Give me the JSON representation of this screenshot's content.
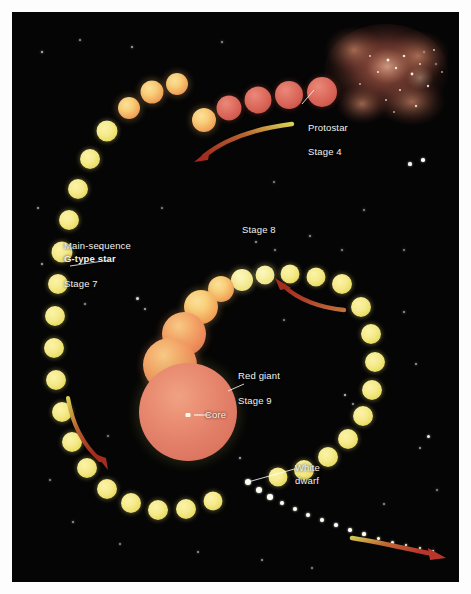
{
  "figure": {
    "background_color": "#050505",
    "page_color": "#fdfdfd"
  },
  "labels": {
    "protostar": "Protostar",
    "stage4": "Stage 4",
    "main_sequence_line1": "Main-sequence",
    "main_sequence_line2": "G-type star",
    "stage7": "Stage 7",
    "stage8": "Stage 8",
    "red_giant": "Red giant",
    "stage9": "Stage 9",
    "core": "Core",
    "white_dwarf_line1": "White",
    "white_dwarf_line2": "dwarf"
  },
  "colors": {
    "label_text": "#f2f2ee",
    "yellow_star": "#f0e487",
    "orange_star": "#f3ac5e",
    "red_star": "#d55f53",
    "red_giant": "#e27f68",
    "arrow_red": "#b8372a",
    "arrow_yellow": "#d8cf5a",
    "nebula": "#a85445"
  },
  "icons": {
    "protostar_leader": "leader-line",
    "main_sequence_leader": "leader-line",
    "red_giant_leader": "leader-line",
    "white_dwarf_leader": "leader-line",
    "core_pointer": "core-marker",
    "arrow_top": "curved-arrow-left",
    "arrow_left": "curved-arrow-down",
    "arrow_center": "curved-arrow-upleft",
    "arrow_bottom": "curved-arrow-right"
  },
  "sequences": {
    "outer_ring_note": "Main-sequence yellow stars forming a large ring",
    "protostar_chain_note": "Contracting protostar spheres fading red to yellow",
    "giant_chain_note": "Expanding spheres growing into the red giant",
    "white_dwarf_trail_note": "Shrinking dots leading to the white dwarf"
  },
  "stars": {
    "outer_ring": [
      {
        "cx": 165,
        "cy": 72,
        "r": 11,
        "tone": "orange"
      },
      {
        "cx": 140,
        "cy": 80,
        "r": 11.5,
        "tone": "orange"
      },
      {
        "cx": 117,
        "cy": 96,
        "r": 11,
        "tone": "orange"
      },
      {
        "cx": 95,
        "cy": 119,
        "r": 10.5,
        "tone": "yellow"
      },
      {
        "cx": 78,
        "cy": 147,
        "r": 10,
        "tone": "yellow"
      },
      {
        "cx": 66,
        "cy": 177,
        "r": 10,
        "tone": "yellow"
      },
      {
        "cx": 57,
        "cy": 208,
        "r": 10,
        "tone": "yellow"
      },
      {
        "cx": 50,
        "cy": 240,
        "r": 10.5,
        "tone": "yellow"
      },
      {
        "cx": 46,
        "cy": 272,
        "r": 10,
        "tone": "yellow"
      },
      {
        "cx": 43,
        "cy": 304,
        "r": 10,
        "tone": "yellow"
      },
      {
        "cx": 42,
        "cy": 336,
        "r": 10,
        "tone": "yellow"
      },
      {
        "cx": 44,
        "cy": 368,
        "r": 10,
        "tone": "yellow"
      },
      {
        "cx": 50,
        "cy": 400,
        "r": 10,
        "tone": "yellow"
      },
      {
        "cx": 60,
        "cy": 430,
        "r": 10,
        "tone": "yellow"
      },
      {
        "cx": 75,
        "cy": 456,
        "r": 10,
        "tone": "yellow"
      },
      {
        "cx": 95,
        "cy": 477,
        "r": 10,
        "tone": "yellow"
      },
      {
        "cx": 119,
        "cy": 491,
        "r": 10,
        "tone": "yellow"
      },
      {
        "cx": 146,
        "cy": 498,
        "r": 10,
        "tone": "yellow"
      },
      {
        "cx": 174,
        "cy": 497,
        "r": 10,
        "tone": "yellow"
      },
      {
        "cx": 201,
        "cy": 489,
        "r": 9.5,
        "tone": "yellow"
      }
    ],
    "protostar_chain": [
      {
        "cx": 310,
        "cy": 80,
        "r": 15,
        "tone": "red"
      },
      {
        "cx": 277,
        "cy": 83,
        "r": 14,
        "tone": "red"
      },
      {
        "cx": 246,
        "cy": 88,
        "r": 13.5,
        "tone": "red"
      },
      {
        "cx": 217,
        "cy": 96,
        "r": 12.5,
        "tone": "red"
      },
      {
        "cx": 192,
        "cy": 108,
        "r": 12,
        "tone": "orange"
      }
    ],
    "inner_ring": [
      {
        "cx": 330,
        "cy": 272,
        "r": 10,
        "tone": "yellow"
      },
      {
        "cx": 349,
        "cy": 295,
        "r": 10,
        "tone": "yellow"
      },
      {
        "cx": 359,
        "cy": 322,
        "r": 10,
        "tone": "yellow"
      },
      {
        "cx": 363,
        "cy": 350,
        "r": 10,
        "tone": "yellow"
      },
      {
        "cx": 360,
        "cy": 378,
        "r": 10,
        "tone": "yellow"
      },
      {
        "cx": 351,
        "cy": 404,
        "r": 10,
        "tone": "yellow"
      },
      {
        "cx": 336,
        "cy": 427,
        "r": 10,
        "tone": "yellow"
      },
      {
        "cx": 316,
        "cy": 445,
        "r": 10,
        "tone": "yellow"
      },
      {
        "cx": 292,
        "cy": 458,
        "r": 10,
        "tone": "yellow"
      },
      {
        "cx": 266,
        "cy": 465,
        "r": 9.5,
        "tone": "yellow"
      },
      {
        "cx": 304,
        "cy": 265,
        "r": 9.5,
        "tone": "yellow"
      },
      {
        "cx": 278,
        "cy": 262,
        "r": 9.5,
        "tone": "yellow"
      }
    ],
    "giant_chain": [
      {
        "cx": 253,
        "cy": 263,
        "r": 9.5,
        "tone": "pale-yellow"
      },
      {
        "cx": 230,
        "cy": 268,
        "r": 11,
        "tone": "pale-yellow"
      },
      {
        "cx": 209,
        "cy": 277,
        "r": 13,
        "tone": "orange"
      },
      {
        "cx": 189,
        "cy": 295,
        "r": 17,
        "tone": "orange"
      },
      {
        "cx": 172,
        "cy": 322,
        "r": 22,
        "tone": "deep-orange"
      },
      {
        "cx": 158,
        "cy": 353,
        "r": 27,
        "tone": "deep-orange"
      }
    ],
    "red_giant": {
      "cx": 176,
      "cy": 400,
      "r": 49
    },
    "core": {
      "cx": 176,
      "cy": 403
    },
    "white_dwarf_trail": [
      {
        "cx": 236,
        "cy": 470,
        "r": 3.4
      },
      {
        "cx": 247,
        "cy": 478,
        "r": 3.0
      },
      {
        "cx": 258,
        "cy": 485,
        "r": 2.7
      },
      {
        "cx": 270,
        "cy": 491,
        "r": 2.4
      },
      {
        "cx": 283,
        "cy": 497,
        "r": 2.2
      },
      {
        "cx": 296,
        "cy": 503,
        "r": 2.0
      },
      {
        "cx": 310,
        "cy": 508,
        "r": 1.9
      },
      {
        "cx": 324,
        "cy": 513,
        "r": 1.8
      },
      {
        "cx": 338,
        "cy": 518,
        "r": 1.7
      },
      {
        "cx": 352,
        "cy": 522,
        "r": 1.6
      },
      {
        "cx": 366,
        "cy": 526,
        "r": 1.5
      },
      {
        "cx": 380,
        "cy": 530,
        "r": 1.5
      },
      {
        "cx": 394,
        "cy": 533,
        "r": 1.4
      },
      {
        "cx": 408,
        "cy": 536,
        "r": 1.4
      },
      {
        "cx": 421,
        "cy": 539,
        "r": 1.3
      }
    ],
    "background": [
      {
        "cx": 30,
        "cy": 40,
        "r": 0.8,
        "a": 0.7
      },
      {
        "cx": 68,
        "cy": 28,
        "r": 0.6,
        "a": 0.5
      },
      {
        "cx": 120,
        "cy": 35,
        "r": 0.7,
        "a": 0.6
      },
      {
        "cx": 210,
        "cy": 30,
        "r": 0.6,
        "a": 0.5
      },
      {
        "cx": 412,
        "cy": 40,
        "r": 1.4,
        "a": 0.9
      },
      {
        "cx": 424,
        "cy": 52,
        "r": 1.0,
        "a": 0.7
      },
      {
        "cx": 398,
        "cy": 152,
        "r": 1.6,
        "a": 0.95
      },
      {
        "cx": 411,
        "cy": 148,
        "r": 1.8,
        "a": 1.0
      },
      {
        "cx": 26,
        "cy": 196,
        "r": 0.8,
        "a": 0.6
      },
      {
        "cx": 30,
        "cy": 252,
        "r": 1.0,
        "a": 0.7
      },
      {
        "cx": 88,
        "cy": 236,
        "r": 0.7,
        "a": 0.5
      },
      {
        "cx": 73,
        "cy": 292,
        "r": 0.9,
        "a": 0.6
      },
      {
        "cx": 125,
        "cy": 286,
        "r": 1.5,
        "a": 0.85
      },
      {
        "cx": 133,
        "cy": 297,
        "r": 1.1,
        "a": 0.7
      },
      {
        "cx": 244,
        "cy": 230,
        "r": 0.9,
        "a": 0.6
      },
      {
        "cx": 263,
        "cy": 238,
        "r": 0.7,
        "a": 0.5
      },
      {
        "cx": 298,
        "cy": 224,
        "r": 0.8,
        "a": 0.55
      },
      {
        "cx": 330,
        "cy": 238,
        "r": 0.7,
        "a": 0.5
      },
      {
        "cx": 392,
        "cy": 300,
        "r": 0.8,
        "a": 0.55
      },
      {
        "cx": 404,
        "cy": 352,
        "r": 0.9,
        "a": 0.6
      },
      {
        "cx": 333,
        "cy": 383,
        "r": 1.3,
        "a": 0.8
      },
      {
        "cx": 341,
        "cy": 392,
        "r": 0.9,
        "a": 0.6
      },
      {
        "cx": 416,
        "cy": 424,
        "r": 1.5,
        "a": 0.9
      },
      {
        "cx": 408,
        "cy": 436,
        "r": 0.9,
        "a": 0.6
      },
      {
        "cx": 38,
        "cy": 468,
        "r": 0.7,
        "a": 0.5
      },
      {
        "cx": 61,
        "cy": 510,
        "r": 0.8,
        "a": 0.55
      },
      {
        "cx": 108,
        "cy": 532,
        "r": 0.7,
        "a": 0.5
      },
      {
        "cx": 186,
        "cy": 540,
        "r": 0.8,
        "a": 0.55
      },
      {
        "cx": 228,
        "cy": 446,
        "r": 1.0,
        "a": 0.7
      },
      {
        "cx": 206,
        "cy": 412,
        "r": 0.7,
        "a": 0.5
      },
      {
        "cx": 250,
        "cy": 548,
        "r": 0.8,
        "a": 0.55
      },
      {
        "cx": 300,
        "cy": 556,
        "r": 0.7,
        "a": 0.5
      },
      {
        "cx": 372,
        "cy": 492,
        "r": 0.8,
        "a": 0.55
      },
      {
        "cx": 425,
        "cy": 478,
        "r": 0.7,
        "a": 0.5
      },
      {
        "cx": 150,
        "cy": 196,
        "r": 0.6,
        "a": 0.45
      },
      {
        "cx": 262,
        "cy": 170,
        "r": 0.6,
        "a": 0.45
      },
      {
        "cx": 352,
        "cy": 198,
        "r": 0.7,
        "a": 0.5
      },
      {
        "cx": 96,
        "cy": 424,
        "r": 0.6,
        "a": 0.45
      },
      {
        "cx": 272,
        "cy": 308,
        "r": 0.6,
        "a": 0.45
      },
      {
        "cx": 392,
        "cy": 238,
        "r": 0.6,
        "a": 0.45
      }
    ]
  }
}
